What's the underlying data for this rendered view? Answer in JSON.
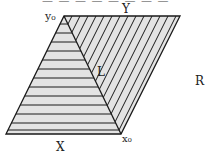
{
  "figure": {
    "top_text_cutoff": "— — — — — — — —",
    "labels": {
      "Y": "Y",
      "y0": "y₀",
      "L": "L",
      "R": "R",
      "X": "X",
      "x0": "x₀"
    },
    "colors": {
      "stroke": "#1a1a1a",
      "fill": "#e3e3e3",
      "background": "#ffffff"
    },
    "geometry": {
      "parallelogram": [
        [
          64,
          16
        ],
        [
          180,
          16
        ],
        [
          121,
          134
        ],
        [
          6,
          134
        ]
      ],
      "triangle": [
        [
          64,
          16
        ],
        [
          121,
          134
        ],
        [
          6,
          134
        ]
      ],
      "line_L": [
        [
          64,
          16
        ],
        [
          121,
          134
        ]
      ],
      "horizontal_hatch_y": [
        24,
        33,
        42,
        51,
        60,
        69,
        78,
        87,
        96,
        105,
        114,
        123,
        130
      ],
      "diagonal_hatch_top_x": [
        72,
        80,
        88,
        96,
        104,
        112,
        120,
        128,
        136,
        144,
        152,
        160,
        168,
        176
      ]
    }
  }
}
